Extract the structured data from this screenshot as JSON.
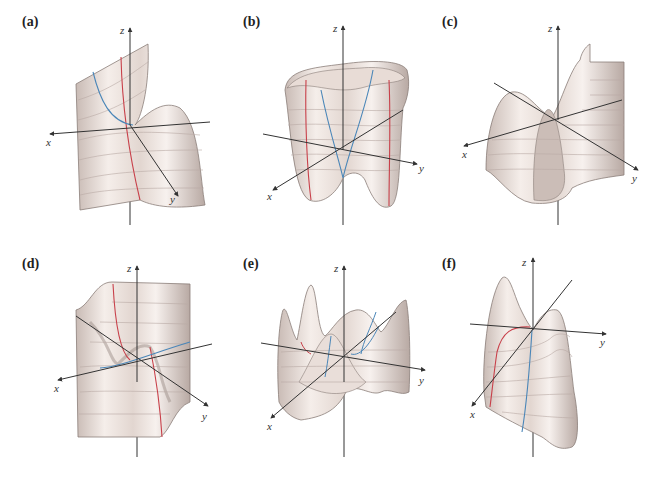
{
  "figure": {
    "panels": [
      {
        "id": "a",
        "label": "(a)",
        "axes": {
          "x": "x",
          "y": "y",
          "z": "z"
        },
        "description": "saddle-like surface with a sheet rising toward -x and a ridge along +y"
      },
      {
        "id": "b",
        "label": "(b)",
        "axes": {
          "x": "x",
          "y": "y",
          "z": "z"
        },
        "description": "bowl/cup-shaped surface with four lobes and two lower minima"
      },
      {
        "id": "c",
        "label": "(c)",
        "axes": {
          "x": "x",
          "y": "y",
          "z": "z"
        },
        "description": "surface with a vertical fin near origin and sheets rising on both sides"
      },
      {
        "id": "d",
        "label": "(d)",
        "axes": {
          "x": "x",
          "y": "y",
          "z": "z"
        },
        "description": "wavy sheet with an S-shaped fold passing through the origin"
      },
      {
        "id": "e",
        "label": "(e)",
        "axes": {
          "x": "x",
          "y": "y",
          "z": "z"
        },
        "description": "oscillating surface with multiple peaks and valleys"
      },
      {
        "id": "f",
        "label": "(f)",
        "axes": {
          "x": "x",
          "y": "y",
          "z": "z"
        },
        "description": "surface with two peaks meeting at origin and a trough below"
      }
    ],
    "colors": {
      "surface_light": "#f3ece8",
      "surface_mid": "#ddd0ca",
      "surface_dark": "#9e908a",
      "axis": "#333333",
      "trace_red": "#c8404a",
      "trace_blue": "#4a86b8",
      "gridline": "#b9aaa4"
    }
  }
}
